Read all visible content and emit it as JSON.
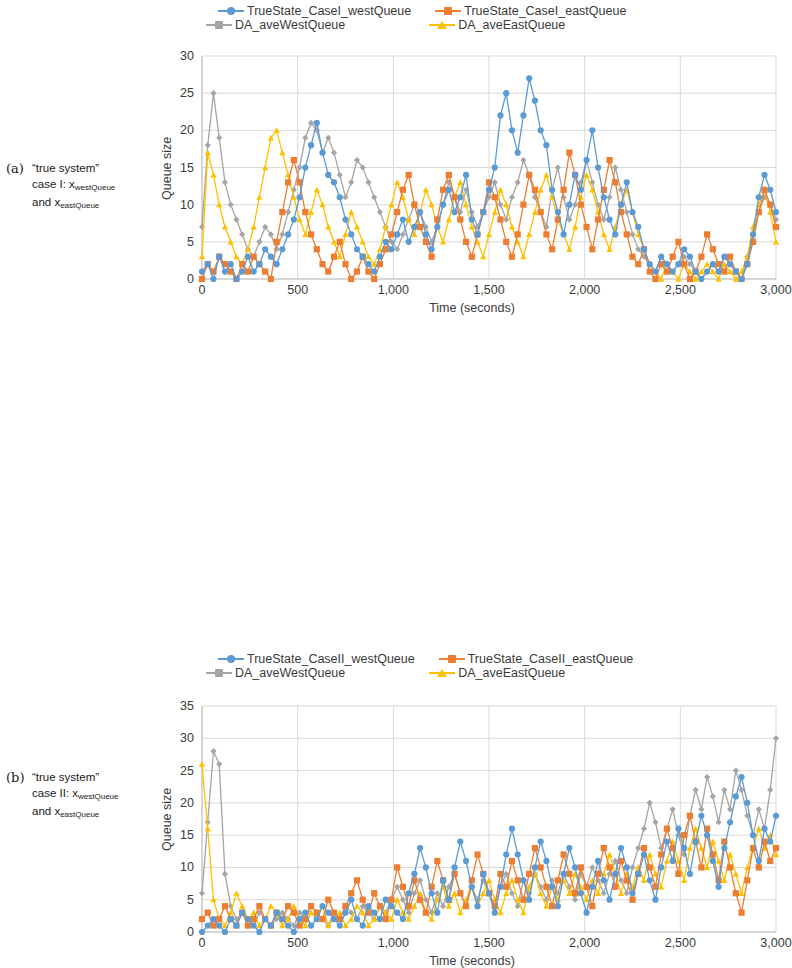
{
  "figure": {
    "panels": [
      {
        "id": "a",
        "caption_label": "(a)",
        "caption_lines": [
          "“true system”",
          "case I: x",
          "and x"
        ],
        "caption_sub": [
          "",
          "westQueue",
          "eastQueue"
        ]
      },
      {
        "id": "b",
        "caption_label": "(b)",
        "caption_lines": [
          "“true system”",
          "case II: x",
          "and x"
        ],
        "caption_sub": [
          "",
          "westQueue",
          "eastQueue"
        ]
      }
    ]
  },
  "colors": {
    "blue": "#5B9BD5",
    "orange": "#ED7D31",
    "gray": "#A5A5A5",
    "yellow": "#FFC000",
    "grid": "#D9D9D9",
    "axis": "#BFBFBF",
    "text": "#3A3A3A"
  },
  "chart_data": [
    {
      "type": "line",
      "id": "chart-a",
      "title": "",
      "xlabel": "Time (seconds)",
      "ylabel": "Queue size",
      "xlim": [
        0,
        3000
      ],
      "ylim": [
        0,
        30
      ],
      "xticks": [
        0,
        500,
        1000,
        1500,
        2000,
        2500,
        3000
      ],
      "xticklabels": [
        "0",
        "500",
        "1,000",
        "1,500",
        "2,000",
        "2,500",
        "3,000"
      ],
      "yticks": [
        0,
        5,
        10,
        15,
        20,
        25,
        30
      ],
      "yticklabels": [
        "0",
        "5",
        "10",
        "15",
        "20",
        "25",
        "30"
      ],
      "grid": true,
      "legend_position": "top",
      "x": [
        0,
        30,
        60,
        90,
        120,
        150,
        180,
        210,
        240,
        270,
        300,
        330,
        360,
        390,
        420,
        450,
        480,
        510,
        540,
        570,
        600,
        630,
        660,
        690,
        720,
        750,
        780,
        810,
        840,
        870,
        900,
        930,
        960,
        990,
        1020,
        1050,
        1080,
        1110,
        1140,
        1170,
        1200,
        1230,
        1260,
        1290,
        1320,
        1350,
        1380,
        1410,
        1440,
        1470,
        1500,
        1530,
        1560,
        1590,
        1620,
        1650,
        1680,
        1710,
        1740,
        1770,
        1800,
        1830,
        1860,
        1890,
        1920,
        1950,
        1980,
        2010,
        2040,
        2070,
        2100,
        2130,
        2160,
        2190,
        2220,
        2250,
        2280,
        2310,
        2340,
        2370,
        2400,
        2430,
        2460,
        2490,
        2520,
        2550,
        2580,
        2610,
        2640,
        2670,
        2700,
        2730,
        2760,
        2790,
        2820,
        2850,
        2880,
        2910,
        2940,
        2970,
        3000
      ],
      "series": [
        {
          "name": "TrueState_CaseI_westQueue",
          "color": "#5B9BD5",
          "marker": "circle",
          "values": [
            1,
            2,
            0,
            3,
            1,
            2,
            0,
            1,
            3,
            1,
            2,
            4,
            3,
            2,
            4,
            6,
            8,
            11,
            15,
            18,
            21,
            17,
            14,
            13,
            11,
            8,
            6,
            4,
            3,
            2,
            1,
            3,
            5,
            4,
            6,
            8,
            5,
            7,
            9,
            6,
            4,
            7,
            10,
            12,
            9,
            11,
            14,
            8,
            6,
            9,
            12,
            15,
            22,
            25,
            20,
            17,
            22,
            27,
            24,
            20,
            18,
            12,
            9,
            6,
            10,
            14,
            12,
            16,
            20,
            15,
            11,
            8,
            6,
            10,
            13,
            9,
            7,
            4,
            2,
            1,
            3,
            2,
            1,
            2,
            4,
            3,
            1,
            0,
            1,
            2,
            1,
            3,
            2,
            1,
            0,
            2,
            6,
            11,
            14,
            12,
            9
          ]
        },
        {
          "name": "TrueState_CaseI_eastQueue",
          "color": "#ED7D31",
          "marker": "square",
          "values": [
            0,
            2,
            1,
            3,
            2,
            1,
            0,
            2,
            1,
            3,
            2,
            1,
            0,
            5,
            9,
            13,
            16,
            13,
            9,
            6,
            4,
            2,
            1,
            3,
            5,
            2,
            0,
            1,
            3,
            1,
            0,
            2,
            4,
            6,
            9,
            12,
            14,
            10,
            7,
            5,
            3,
            8,
            12,
            14,
            11,
            8,
            5,
            3,
            6,
            9,
            13,
            11,
            8,
            5,
            3,
            6,
            10,
            14,
            12,
            9,
            6,
            4,
            8,
            12,
            17,
            14,
            10,
            7,
            4,
            8,
            12,
            16,
            13,
            9,
            6,
            3,
            2,
            4,
            1,
            0,
            2,
            1,
            3,
            5,
            2,
            0,
            1,
            3,
            6,
            4,
            2,
            1,
            3,
            1,
            0,
            2,
            5,
            9,
            12,
            10,
            7
          ]
        },
        {
          "name": "DA_aveWestQueue",
          "color": "#A5A5A5",
          "marker": "diamond",
          "values": [
            7,
            18,
            25,
            19,
            13,
            10,
            8,
            6,
            4,
            3,
            5,
            7,
            6,
            4,
            6,
            9,
            12,
            15,
            19,
            21,
            20,
            17,
            19,
            17,
            14,
            11,
            13,
            16,
            15,
            13,
            11,
            9,
            7,
            5,
            4,
            6,
            8,
            10,
            9,
            7,
            5,
            7,
            10,
            13,
            11,
            9,
            12,
            9,
            7,
            9,
            11,
            13,
            10,
            8,
            11,
            13,
            16,
            14,
            11,
            9,
            7,
            12,
            15,
            11,
            8,
            10,
            13,
            16,
            13,
            10,
            8,
            11,
            15,
            12,
            9,
            6,
            4,
            3,
            2,
            1,
            3,
            2,
            1,
            2,
            3,
            2,
            1,
            0,
            1,
            2,
            1,
            3,
            2,
            1,
            0,
            3,
            6,
            9,
            11,
            10,
            8
          ]
        },
        {
          "name": "DA_aveEastQueue",
          "color": "#FFC000",
          "marker": "triangle",
          "values": [
            3,
            17,
            14,
            10,
            7,
            5,
            3,
            2,
            4,
            7,
            11,
            15,
            19,
            20,
            17,
            14,
            11,
            8,
            6,
            9,
            12,
            10,
            7,
            5,
            3,
            6,
            9,
            7,
            5,
            3,
            2,
            4,
            7,
            10,
            13,
            11,
            8,
            6,
            9,
            12,
            10,
            7,
            5,
            8,
            11,
            13,
            10,
            7,
            5,
            3,
            6,
            9,
            12,
            10,
            7,
            5,
            3,
            6,
            9,
            12,
            14,
            11,
            8,
            6,
            4,
            7,
            11,
            14,
            12,
            9,
            6,
            4,
            7,
            10,
            12,
            9,
            6,
            4,
            2,
            1,
            0,
            2,
            1,
            0,
            2,
            1,
            0,
            1,
            2,
            1,
            0,
            2,
            1,
            0,
            1,
            3,
            7,
            10,
            12,
            9,
            5
          ]
        }
      ]
    },
    {
      "type": "line",
      "id": "chart-b",
      "title": "",
      "xlabel": "Time (seconds)",
      "ylabel": "Queue size",
      "xlim": [
        0,
        3000
      ],
      "ylim": [
        0,
        35
      ],
      "xticks": [
        0,
        500,
        1000,
        1500,
        2000,
        2500,
        3000
      ],
      "xticklabels": [
        "0",
        "500",
        "1,000",
        "1,500",
        "2,000",
        "2,500",
        "3,000"
      ],
      "yticks": [
        0,
        5,
        10,
        15,
        20,
        25,
        30,
        35
      ],
      "yticklabels": [
        "0",
        "5",
        "10",
        "15",
        "20",
        "25",
        "30",
        "35"
      ],
      "grid": true,
      "legend_position": "top",
      "x": [
        0,
        30,
        60,
        90,
        120,
        150,
        180,
        210,
        240,
        270,
        300,
        330,
        360,
        390,
        420,
        450,
        480,
        510,
        540,
        570,
        600,
        630,
        660,
        690,
        720,
        750,
        780,
        810,
        840,
        870,
        900,
        930,
        960,
        990,
        1020,
        1050,
        1080,
        1110,
        1140,
        1170,
        1200,
        1230,
        1260,
        1290,
        1320,
        1350,
        1380,
        1410,
        1440,
        1470,
        1500,
        1530,
        1560,
        1590,
        1620,
        1650,
        1680,
        1710,
        1740,
        1770,
        1800,
        1830,
        1860,
        1890,
        1920,
        1950,
        1980,
        2010,
        2040,
        2070,
        2100,
        2130,
        2160,
        2190,
        2220,
        2250,
        2280,
        2310,
        2340,
        2370,
        2400,
        2430,
        2460,
        2490,
        2520,
        2550,
        2580,
        2610,
        2640,
        2670,
        2700,
        2730,
        2760,
        2790,
        2820,
        2850,
        2880,
        2910,
        2940,
        2970,
        3000
      ],
      "series": [
        {
          "name": "TrueState_CaseII_westQueue",
          "color": "#5B9BD5",
          "marker": "circle",
          "values": [
            0,
            1,
            2,
            1,
            0,
            2,
            1,
            3,
            2,
            1,
            0,
            2,
            1,
            3,
            2,
            1,
            0,
            2,
            3,
            1,
            2,
            4,
            3,
            2,
            1,
            3,
            5,
            2,
            1,
            4,
            3,
            2,
            5,
            4,
            3,
            2,
            6,
            9,
            13,
            10,
            6,
            3,
            8,
            5,
            10,
            14,
            11,
            7,
            4,
            9,
            6,
            3,
            7,
            12,
            16,
            12,
            8,
            5,
            10,
            14,
            11,
            7,
            4,
            9,
            13,
            10,
            6,
            3,
            7,
            11,
            8,
            5,
            9,
            13,
            10,
            6,
            9,
            12,
            8,
            5,
            10,
            14,
            11,
            16,
            13,
            9,
            14,
            18,
            15,
            11,
            7,
            13,
            17,
            21,
            24,
            20,
            15,
            11,
            16,
            14,
            18
          ]
        },
        {
          "name": "TrueState_CaseII_eastQueue",
          "color": "#ED7D31",
          "marker": "square",
          "values": [
            2,
            3,
            1,
            2,
            4,
            2,
            1,
            3,
            1,
            2,
            4,
            2,
            1,
            3,
            2,
            4,
            3,
            1,
            2,
            4,
            3,
            2,
            5,
            3,
            2,
            4,
            6,
            8,
            5,
            3,
            6,
            4,
            2,
            5,
            10,
            7,
            4,
            8,
            5,
            3,
            7,
            11,
            8,
            5,
            9,
            6,
            4,
            8,
            12,
            9,
            6,
            4,
            9,
            7,
            11,
            8,
            5,
            9,
            13,
            10,
            7,
            4,
            8,
            12,
            9,
            6,
            10,
            7,
            4,
            9,
            13,
            10,
            7,
            11,
            8,
            5,
            9,
            13,
            10,
            7,
            12,
            16,
            13,
            9,
            15,
            18,
            14,
            10,
            16,
            12,
            8,
            14,
            10,
            6,
            3,
            8,
            13,
            10,
            14,
            11,
            13
          ]
        },
        {
          "name": "DA_aveWestQueue",
          "color": "#A5A5A5",
          "marker": "diamond",
          "values": [
            6,
            17,
            28,
            26,
            9,
            4,
            2,
            3,
            2,
            1,
            3,
            2,
            1,
            2,
            3,
            2,
            1,
            3,
            2,
            4,
            3,
            2,
            1,
            3,
            2,
            4,
            3,
            2,
            4,
            3,
            2,
            4,
            3,
            5,
            7,
            5,
            3,
            6,
            8,
            5,
            3,
            6,
            4,
            7,
            9,
            6,
            4,
            7,
            5,
            8,
            6,
            4,
            7,
            9,
            6,
            4,
            8,
            6,
            9,
            7,
            5,
            8,
            6,
            9,
            7,
            5,
            9,
            7,
            10,
            8,
            6,
            9,
            11,
            8,
            6,
            10,
            13,
            16,
            20,
            17,
            13,
            16,
            19,
            15,
            12,
            18,
            22,
            19,
            24,
            21,
            17,
            22,
            19,
            25,
            22,
            18,
            15,
            19,
            16,
            22,
            30
          ]
        },
        {
          "name": "DA_aveEastQueue",
          "color": "#FFC000",
          "marker": "triangle",
          "values": [
            26,
            16,
            5,
            2,
            1,
            3,
            6,
            4,
            2,
            3,
            1,
            2,
            4,
            3,
            1,
            2,
            4,
            2,
            1,
            3,
            2,
            4,
            1,
            2,
            3,
            1,
            2,
            4,
            3,
            1,
            2,
            4,
            3,
            2,
            5,
            3,
            2,
            4,
            6,
            3,
            2,
            5,
            7,
            4,
            6,
            3,
            5,
            7,
            4,
            6,
            8,
            5,
            3,
            6,
            8,
            5,
            3,
            7,
            9,
            6,
            4,
            7,
            5,
            8,
            6,
            9,
            7,
            5,
            8,
            6,
            9,
            12,
            9,
            6,
            9,
            7,
            10,
            8,
            12,
            9,
            7,
            11,
            14,
            11,
            8,
            13,
            16,
            13,
            10,
            14,
            11,
            8,
            12,
            9,
            6,
            10,
            13,
            16,
            13,
            15,
            12
          ]
        }
      ]
    }
  ]
}
